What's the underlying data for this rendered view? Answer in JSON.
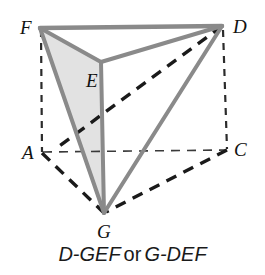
{
  "figure": {
    "kind": "geometry-diagram",
    "background_color": "#ffffff",
    "solid_edge_color": "#8a8a8a",
    "hidden_edge_color": "#1a1a1a",
    "thin_hidden_edge_color": "#2b2b2b",
    "shaded_face_color": "#e2e2e2",
    "label_color": "#111111",
    "vertices": [
      {
        "id": "F",
        "label": "F",
        "x": 40,
        "y": 28,
        "label_x": 20,
        "label_y": 18
      },
      {
        "id": "D",
        "label": "D",
        "x": 222,
        "y": 26,
        "label_x": 233,
        "label_y": 17
      },
      {
        "id": "E",
        "label": "E",
        "x": 101,
        "y": 62,
        "label_x": 86,
        "label_y": 71
      },
      {
        "id": "A",
        "label": "A",
        "x": 42,
        "y": 153,
        "label_x": 22,
        "label_y": 143
      },
      {
        "id": "C",
        "label": "C",
        "x": 227,
        "y": 150,
        "label_x": 234,
        "label_y": 140
      },
      {
        "id": "G",
        "label": "G",
        "x": 104,
        "y": 213,
        "label_x": 97,
        "label_y": 222
      }
    ],
    "shaded_faces": [
      {
        "name": "face-FEG",
        "points": "40,28 101,62 104,213"
      }
    ],
    "solid_edges": [
      {
        "name": "edge-F-D",
        "x1": 40,
        "y1": 28,
        "x2": 222,
        "y2": 26
      },
      {
        "name": "edge-F-E",
        "x1": 40,
        "y1": 28,
        "x2": 101,
        "y2": 62
      },
      {
        "name": "edge-E-D",
        "x1": 101,
        "y1": 62,
        "x2": 222,
        "y2": 26
      },
      {
        "name": "edge-F-G",
        "x1": 40,
        "y1": 28,
        "x2": 104,
        "y2": 213
      },
      {
        "name": "edge-E-G",
        "x1": 101,
        "y1": 62,
        "x2": 104,
        "y2": 213
      },
      {
        "name": "edge-D-G",
        "x1": 222,
        "y1": 26,
        "x2": 104,
        "y2": 213
      }
    ],
    "hidden_edges_thick": [
      {
        "name": "edge-D-B-hidden",
        "x1": 222,
        "y1": 26,
        "x2": 60,
        "y2": 146
      },
      {
        "name": "edge-A-G-hidden",
        "x1": 42,
        "y1": 153,
        "x2": 104,
        "y2": 213
      },
      {
        "name": "edge-C-G-hidden",
        "x1": 227,
        "y1": 150,
        "x2": 104,
        "y2": 213
      }
    ],
    "hidden_edges_thin": [
      {
        "name": "edge-F-A-hidden",
        "x1": 41,
        "y1": 30,
        "x2": 42,
        "y2": 152
      },
      {
        "name": "edge-D-C-hidden",
        "x1": 223,
        "y1": 30,
        "x2": 227,
        "y2": 149
      },
      {
        "name": "edge-A-C-hidden",
        "x1": 43,
        "y1": 152,
        "x2": 226,
        "y2": 150
      }
    ]
  },
  "caption": {
    "first_name": "D-GEF",
    "conjunction": "or",
    "second_name": "G-DEF"
  }
}
